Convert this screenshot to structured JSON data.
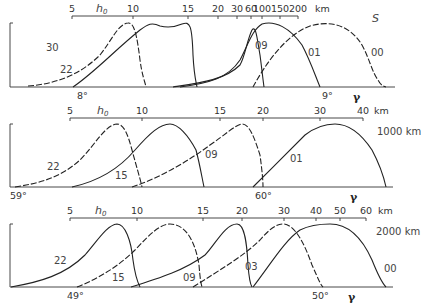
{
  "chart_data": [
    {
      "type": "line",
      "panel": "top",
      "title": "",
      "label_right": "S",
      "top_axis": {
        "symbol": "h0",
        "unit": "km",
        "ticks": [
          "5",
          "10",
          "15",
          "20",
          "30",
          "60",
          "100",
          "150",
          "200"
        ]
      },
      "bottom_axis": {
        "symbol": "γ",
        "ticks": [
          "8°",
          "9°"
        ]
      },
      "series": [
        {
          "name": "30",
          "style": "dashed"
        },
        {
          "name": "22",
          "style": "solid"
        },
        {
          "name": "09",
          "style": "solid"
        },
        {
          "name": "01",
          "style": "solid"
        },
        {
          "name": "00",
          "style": "dashed"
        }
      ]
    },
    {
      "type": "line",
      "panel": "middle",
      "title": "",
      "label_right": "1000 km",
      "top_axis": {
        "symbol": "h0",
        "unit": "km",
        "ticks": [
          "5",
          "10",
          "15",
          "20",
          "30",
          "40"
        ]
      },
      "bottom_axis": {
        "symbol": "γ",
        "ticks": [
          "59°",
          "60°"
        ]
      },
      "series": [
        {
          "name": "22",
          "style": "dashed"
        },
        {
          "name": "15",
          "style": "solid"
        },
        {
          "name": "09",
          "style": "dashed"
        },
        {
          "name": "01",
          "style": "solid"
        }
      ]
    },
    {
      "type": "line",
      "panel": "bottom",
      "title": "",
      "label_right": "2000 km",
      "top_axis": {
        "symbol": "h0",
        "unit": "km",
        "ticks": [
          "5",
          "10",
          "15",
          "20",
          "30",
          "40",
          "50",
          "60"
        ]
      },
      "bottom_axis": {
        "symbol": "γ",
        "ticks": [
          "49°",
          "50°"
        ]
      },
      "series": [
        {
          "name": "22",
          "style": "solid"
        },
        {
          "name": "15",
          "style": "dashed"
        },
        {
          "name": "09",
          "style": "solid"
        },
        {
          "name": "03",
          "style": "dashed"
        },
        {
          "name": "00",
          "style": "solid"
        }
      ]
    }
  ]
}
